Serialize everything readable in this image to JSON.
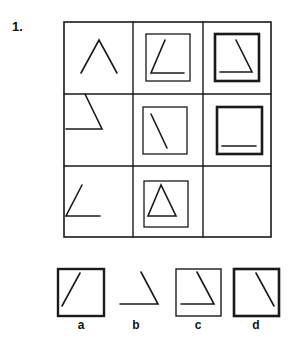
{
  "question": {
    "number_label": "1."
  },
  "matrix": {
    "rows": 3,
    "cols": 3,
    "cells": [
      {
        "row": 1,
        "col": 1,
        "frame": "none",
        "figure": "caret-open-V"
      },
      {
        "row": 1,
        "col": 2,
        "frame": "thin-square",
        "figure": "left-slant-line-with-base"
      },
      {
        "row": 1,
        "col": 3,
        "frame": "thick-square",
        "figure": "right-slant-line-with-base"
      },
      {
        "row": 2,
        "col": 1,
        "frame": "none",
        "figure": "right-slant-line-with-base"
      },
      {
        "row": 2,
        "col": 2,
        "frame": "thin-square",
        "figure": "right-slant-line"
      },
      {
        "row": 2,
        "col": 3,
        "frame": "thick-square",
        "figure": "base-line"
      },
      {
        "row": 3,
        "col": 1,
        "frame": "none",
        "figure": "left-slant-line-with-base"
      },
      {
        "row": 3,
        "col": 2,
        "frame": "thin-square",
        "figure": "triangle"
      },
      {
        "row": 3,
        "col": 3,
        "frame": "none",
        "figure": "empty-missing"
      }
    ]
  },
  "options": [
    {
      "label": "a",
      "frame": "thick-square",
      "figure": "left-slant-line"
    },
    {
      "label": "b",
      "frame": "none",
      "figure": "right-slant-line-with-base"
    },
    {
      "label": "c",
      "frame": "thin-square",
      "figure": "right-slant-line-with-base"
    },
    {
      "label": "d",
      "frame": "thick-square",
      "figure": "right-slant-line"
    }
  ],
  "colors": {
    "ink": "#1a1a1a",
    "background": "#ffffff"
  }
}
